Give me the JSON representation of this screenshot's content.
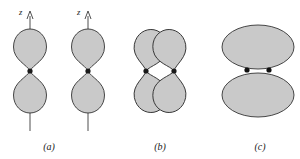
{
  "figure": {
    "title": "",
    "width": 300,
    "height": 159,
    "background": "#ffffff",
    "lobe_fill": "#c9c9c9",
    "lobe_stroke": "#333333",
    "axis_color": "#3a3a3a",
    "dot_color": "#111111"
  },
  "panels": [
    {
      "id": "a",
      "label": "(a)",
      "caption_x": 49,
      "caption_y": 150,
      "description": "two separate p orbitals each aligned along its own z axis",
      "axis_label": "z",
      "orbitals": [
        {
          "center_x": 30,
          "center_y": 71,
          "axis_top_y": 11,
          "axis_bottom_y": 131,
          "label_x": 21,
          "label_y": 12
        },
        {
          "center_x": 88,
          "center_y": 71,
          "axis_top_y": 11,
          "axis_bottom_y": 131,
          "label_x": 79,
          "label_y": 12
        }
      ]
    },
    {
      "id": "b",
      "label": "(b)",
      "caption_x": 160,
      "caption_y": 150,
      "description": "two p orbitals tilted toward each other so the lobes overlap",
      "axis_label": "",
      "orbitals": [
        {
          "center_x": 146,
          "center_y": 71,
          "tilt_deg": 10
        },
        {
          "center_x": 174,
          "center_y": 71,
          "tilt_deg": -10
        }
      ]
    },
    {
      "id": "c",
      "label": "(c)",
      "caption_x": 260,
      "caption_y": 150,
      "description": "resulting molecular orbital shown as two ellipses with a bonding electron pair between them",
      "axis_label": "",
      "ellipses": [
        {
          "cx": 258,
          "cy": 47,
          "rx": 36,
          "ry": 22
        },
        {
          "cx": 258,
          "cy": 95,
          "rx": 36,
          "ry": 22
        }
      ],
      "electrons": [
        {
          "cx": 247,
          "cy": 70,
          "r": 2.6
        },
        {
          "cx": 269,
          "cy": 70,
          "r": 2.6
        }
      ]
    }
  ],
  "icons": {
    "arrow": "axis-arrow-icon",
    "nucleus": "nucleus-dot-icon",
    "electron": "electron-dot-icon"
  }
}
